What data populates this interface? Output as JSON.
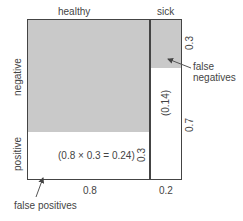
{
  "diagram": {
    "columns": {
      "healthy": "healthy",
      "sick": "sick"
    },
    "rows": {
      "negative": "negative",
      "positive": "positive"
    },
    "bottom_axis": {
      "healthy_width": "0.8",
      "sick_width": "0.2"
    },
    "right_axis": {
      "top": "0.3",
      "bottom": "0.7"
    },
    "inner_labels": {
      "healthy_positive_calc": "(0.8 × 0.3 = 0.24)",
      "healthy_positive_height": "0.3",
      "sick_positive": "(0.14)"
    },
    "annotations": {
      "false_negatives_line1": "false",
      "false_negatives_line2": "negatives",
      "false_positives": "false positives"
    },
    "colors": {
      "shaded": "#c9c9c9",
      "border": "#444444"
    }
  }
}
